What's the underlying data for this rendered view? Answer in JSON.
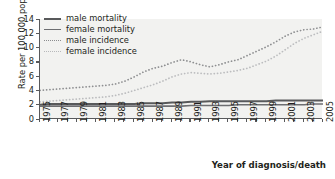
{
  "chart_data": {
    "type": "line",
    "title": "",
    "xlabel": "Year of diagnosis/death",
    "ylabel": "Rate per 100 000 population",
    "xlim": [
      1975,
      2005
    ],
    "ylim": [
      0,
      14
    ],
    "yticks": [
      0,
      2,
      4,
      6,
      8,
      10,
      12,
      14
    ],
    "xticks": [
      1975,
      1977,
      1979,
      1981,
      1983,
      1985,
      1987,
      1989,
      1991,
      1993,
      1995,
      1997,
      1999,
      2001,
      2003,
      2005
    ],
    "x": [
      1975,
      1976,
      1977,
      1978,
      1979,
      1980,
      1981,
      1982,
      1983,
      1984,
      1985,
      1986,
      1987,
      1988,
      1989,
      1990,
      1991,
      1992,
      1993,
      1994,
      1995,
      1996,
      1997,
      1998,
      1999,
      2000,
      2001,
      2002,
      2003,
      2004,
      2005
    ],
    "grid": false,
    "legend_position": "top-left",
    "series": [
      {
        "name": "male mortality",
        "style": "solid",
        "color": "#58595b",
        "width": 2.0,
        "values": [
          2.0,
          2.1,
          2.1,
          2.1,
          2.1,
          2.1,
          2.1,
          2.1,
          2.1,
          2.1,
          2.1,
          2.2,
          2.2,
          2.2,
          2.3,
          2.3,
          2.4,
          2.4,
          2.5,
          2.5,
          2.5,
          2.5,
          2.5,
          2.5,
          2.5,
          2.6,
          2.6,
          2.6,
          2.6,
          2.6,
          2.6
        ]
      },
      {
        "name": "female mortality",
        "style": "solid",
        "color": "#6d6e71",
        "width": 1.6,
        "values": [
          1.8,
          1.8,
          1.8,
          1.8,
          1.8,
          1.8,
          1.8,
          1.8,
          1.8,
          1.8,
          1.8,
          1.8,
          1.8,
          1.8,
          1.8,
          1.8,
          1.9,
          1.9,
          1.9,
          1.9,
          1.9,
          2.0,
          2.0,
          2.0,
          2.0,
          2.0,
          2.0,
          2.0,
          2.0,
          2.1,
          2.1
        ]
      },
      {
        "name": "male incidence",
        "style": "dotted",
        "color": "#8e8f91",
        "width": 1.7,
        "values": [
          4.0,
          4.1,
          4.2,
          4.3,
          4.4,
          4.5,
          4.6,
          4.7,
          4.9,
          5.3,
          5.9,
          6.6,
          7.1,
          7.4,
          7.9,
          8.3,
          8.0,
          7.6,
          7.3,
          7.6,
          8.0,
          8.3,
          8.9,
          9.5,
          10.1,
          10.8,
          11.6,
          12.2,
          12.5,
          12.6,
          12.9
        ]
      },
      {
        "name": "female incidence",
        "style": "dotted",
        "color": "#bcbdbf",
        "width": 1.7,
        "values": [
          2.4,
          2.5,
          2.6,
          2.7,
          2.8,
          2.9,
          3.0,
          3.1,
          3.3,
          3.6,
          4.0,
          4.4,
          4.8,
          5.3,
          5.9,
          6.3,
          6.5,
          6.4,
          6.3,
          6.4,
          6.6,
          6.8,
          7.1,
          7.6,
          8.1,
          8.8,
          9.7,
          10.6,
          11.3,
          11.8,
          12.3
        ]
      }
    ]
  },
  "legend": {
    "items": [
      {
        "label": "male mortality"
      },
      {
        "label": "female mortality"
      },
      {
        "label": "male incidence"
      },
      {
        "label": "female incidence"
      }
    ]
  },
  "colors": {
    "plot_background": "#f2f2f0",
    "axis": "#58595b",
    "text": "#231f20"
  }
}
